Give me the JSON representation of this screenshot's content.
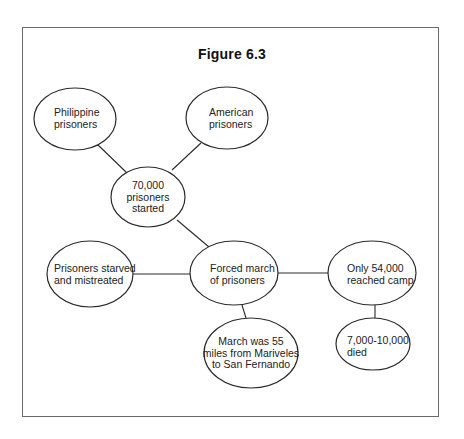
{
  "figure": {
    "title": "Figure 6.3",
    "stroke_color": "#2a2a2a",
    "frame_color": "#6a6a6a"
  },
  "nodes": [
    {
      "id": "philippine",
      "lines": [
        "Philippine",
        "prisoners"
      ],
      "cx": 75,
      "cy": 119,
      "rx": 41,
      "ry": 31
    },
    {
      "id": "american",
      "lines": [
        "American",
        "prisoners"
      ],
      "cx": 227,
      "cy": 118,
      "rx": 41,
      "ry": 31
    },
    {
      "id": "started",
      "lines": [
        "70,000",
        "prisoners",
        "started"
      ],
      "cx": 148,
      "cy": 197,
      "rx": 37,
      "ry": 30
    },
    {
      "id": "starved",
      "lines": [
        "Prisoners starved",
        "and mistreated"
      ],
      "cx": 90,
      "cy": 274,
      "rx": 43,
      "ry": 33
    },
    {
      "id": "march",
      "lines": [
        "Forced march",
        "of prisoners"
      ],
      "cx": 234,
      "cy": 273,
      "rx": 44,
      "ry": 32
    },
    {
      "id": "reached",
      "lines": [
        "Only 54,000",
        "reached camp"
      ],
      "cx": 372,
      "cy": 273,
      "rx": 44,
      "ry": 32
    },
    {
      "id": "distance",
      "lines": [
        "March was 55",
        "miles from Mariveles",
        "to San Fernando"
      ],
      "cx": 251,
      "cy": 353,
      "rx": 47,
      "ry": 35
    },
    {
      "id": "died",
      "lines": [
        "7,000-10,000",
        "died"
      ],
      "cx": 373,
      "cy": 344,
      "rx": 37,
      "ry": 26
    }
  ],
  "edges": [
    {
      "from": "philippine",
      "to": "started"
    },
    {
      "from": "american",
      "to": "started"
    },
    {
      "from": "started",
      "to": "march"
    },
    {
      "from": "starved",
      "to": "march"
    },
    {
      "from": "march",
      "to": "reached"
    },
    {
      "from": "march",
      "to": "distance"
    },
    {
      "from": "reached",
      "to": "died"
    }
  ],
  "labels": {
    "philippine": {
      "l1": "Philippine",
      "l2": "prisoners"
    },
    "american": {
      "l1": "American",
      "l2": "prisoners"
    },
    "started": {
      "l1": "70,000",
      "l2": "prisoners",
      "l3": "started"
    },
    "starved": {
      "l1": "Prisoners starved",
      "l2": "and mistreated"
    },
    "march": {
      "l1": "Forced march",
      "l2": "of prisoners"
    },
    "reached": {
      "l1": "Only 54,000",
      "l2": "reached camp"
    },
    "distance": {
      "l1": "March was 55",
      "l2": "miles from Mariveles",
      "l3": "to San Fernando"
    },
    "died": {
      "l1": "7,000-10,000",
      "l2": "died"
    }
  }
}
